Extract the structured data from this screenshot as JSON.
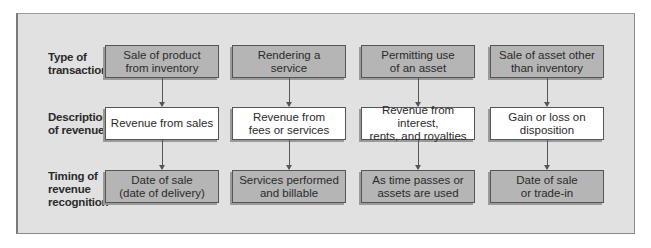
{
  "diagram": {
    "row_labels": [
      {
        "line1": "Type of",
        "line2": "transaction",
        "line3": ""
      },
      {
        "line1": "Description",
        "line2": "of revenue",
        "line3": ""
      },
      {
        "line1": "Timing of",
        "line2": "revenue",
        "line3": "recognition"
      }
    ],
    "columns": [
      {
        "transaction": {
          "line1": "Sale of product",
          "line2": "from inventory"
        },
        "description": {
          "line1": "Revenue from sales",
          "line2": ""
        },
        "timing": {
          "line1": "Date of sale",
          "line2": "(date of delivery)"
        }
      },
      {
        "transaction": {
          "line1": "Rendering a",
          "line2": "service"
        },
        "description": {
          "line1": "Revenue from",
          "line2": "fees or services"
        },
        "timing": {
          "line1": "Services performed",
          "line2": "and billable"
        }
      },
      {
        "transaction": {
          "line1": "Permitting use",
          "line2": "of an asset"
        },
        "description": {
          "line1": "Revenue from interest,",
          "line2": "rents, and royalties"
        },
        "timing": {
          "line1": "As time passes or",
          "line2": "assets are used"
        }
      },
      {
        "transaction": {
          "line1": "Sale of asset other",
          "line2": "than inventory"
        },
        "description": {
          "line1": "Gain or loss on",
          "line2": "disposition"
        },
        "timing": {
          "line1": "Date of sale",
          "line2": "or trade-in"
        }
      }
    ],
    "colors": {
      "panel_bg": "#e1e1e1",
      "gray_box": "#b5b5b5",
      "white_box": "#ffffff",
      "border": "#555555"
    }
  }
}
